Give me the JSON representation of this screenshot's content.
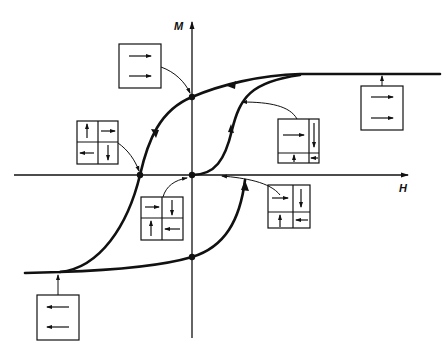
{
  "figure": {
    "axes": {
      "x_label": "H",
      "y_label": "M"
    },
    "colors": {
      "ink": "#111111",
      "background": "#ffffff"
    },
    "points": [
      {
        "id": "remanence",
        "desc": "M axis intercept, upper branch"
      },
      {
        "id": "coercivity",
        "desc": "H axis intercept, upper branch"
      },
      {
        "id": "origin",
        "desc": "demagnetized state"
      },
      {
        "id": "negative-remanence",
        "desc": "M axis intercept, lower branch"
      }
    ],
    "domain_boxes": [
      {
        "id": "remanence-box",
        "layout": "single",
        "arrows": [
          "right",
          "right"
        ]
      },
      {
        "id": "coercive-box",
        "layout": "2x2",
        "arrows": [
          "up",
          "right",
          "left",
          "down"
        ]
      },
      {
        "id": "demagnetized-box",
        "layout": "2x2",
        "arrows": [
          "right",
          "down",
          "up",
          "left"
        ]
      },
      {
        "id": "initial-growth-box",
        "layout": "grown-right",
        "arrows": [
          "right",
          "down",
          "up",
          "left"
        ]
      },
      {
        "id": "initial-low-box",
        "layout": "grown-right",
        "arrows": [
          "right",
          "down",
          "up",
          "left"
        ]
      },
      {
        "id": "positive-saturation-box",
        "layout": "single",
        "arrows": [
          "right",
          "right"
        ]
      },
      {
        "id": "negative-saturation-box",
        "layout": "single",
        "arrows": [
          "left",
          "left"
        ]
      }
    ]
  }
}
